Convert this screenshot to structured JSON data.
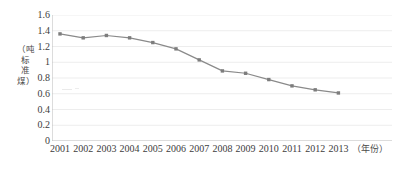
{
  "chart_data": {
    "type": "line",
    "title": "",
    "xlabel": "（年份）",
    "ylabel": "（吨标准煤）",
    "categories": [
      "2001",
      "2002",
      "2003",
      "2004",
      "2005",
      "2006",
      "2007",
      "2008",
      "2009",
      "2010",
      "2011",
      "2012",
      "2013"
    ],
    "values": [
      1.36,
      1.31,
      1.34,
      1.31,
      1.25,
      1.17,
      1.03,
      0.89,
      0.86,
      0.78,
      0.7,
      0.65,
      0.61
    ],
    "series": [
      {
        "name": "",
        "values": [
          1.36,
          1.31,
          1.34,
          1.31,
          1.25,
          1.17,
          1.03,
          0.89,
          0.86,
          0.78,
          0.7,
          0.65,
          0.61
        ]
      }
    ],
    "ylim": [
      0,
      1.6
    ],
    "yticks": [
      "0",
      "0.2",
      "0.4",
      "0.6",
      "0.8",
      "1",
      "1.2",
      "1.4",
      "1.6"
    ],
    "ytick_values": [
      0,
      0.2,
      0.4,
      0.6,
      0.8,
      1.0,
      1.2,
      1.4,
      1.6
    ],
    "grid": true,
    "legend": "none",
    "line_color": "#8a8a8a",
    "marker_color": "#7d7d7d",
    "marker": "square",
    "axis_color": "#b9b9b9",
    "grid_color": "#ededed"
  },
  "axis": {
    "y_title_chars": "（吨标准煤）",
    "x_title": "（年份）"
  }
}
